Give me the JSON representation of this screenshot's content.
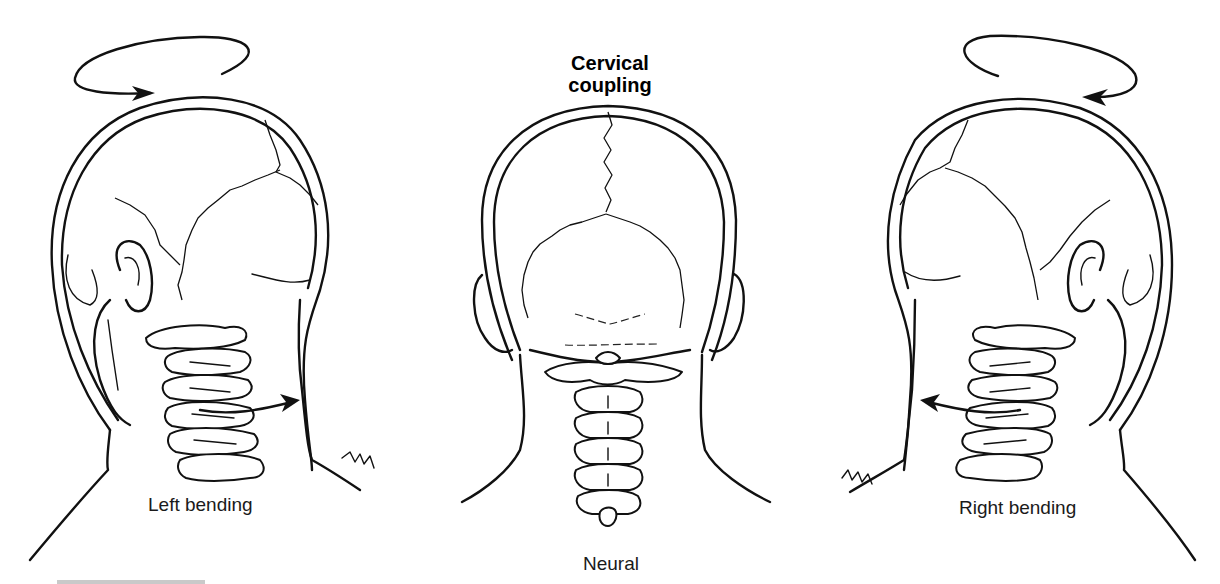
{
  "figure": {
    "title_line1": "Cervical",
    "title_line2": "coupling",
    "panels": [
      {
        "id": "left",
        "label": "Left bending",
        "rotation_arrow": "clockwise-top-view",
        "lateral_arrow": "points-right"
      },
      {
        "id": "center",
        "label": "Neural"
      },
      {
        "id": "right",
        "label": "Right bending",
        "rotation_arrow": "counterclockwise-top-view",
        "lateral_arrow": "points-left"
      }
    ],
    "colors": {
      "ink": "#111111",
      "background": "#ffffff",
      "footer_bar": "#c9c9c9"
    }
  }
}
